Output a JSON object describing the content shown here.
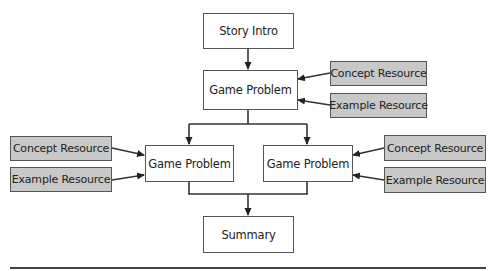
{
  "diagram": {
    "nodes": {
      "story_intro": {
        "label": "Story Intro"
      },
      "game_problem_top": {
        "label": "Game Problem"
      },
      "game_problem_left": {
        "label": "Game Problem"
      },
      "game_problem_right": {
        "label": "Game Problem"
      },
      "summary": {
        "label": "Summary"
      }
    },
    "resources": {
      "top_concept": {
        "label": "Concept Resource"
      },
      "top_example": {
        "label": "Example Resource"
      },
      "left_concept": {
        "label": "Concept Resource"
      },
      "left_example": {
        "label": "Example Resource"
      },
      "right_concept": {
        "label": "Concept Resource"
      },
      "right_example": {
        "label": "Example Resource"
      }
    },
    "colors": {
      "resource_fill": "#c8c8c8",
      "node_fill": "#ffffff",
      "stroke": "#333333"
    }
  }
}
